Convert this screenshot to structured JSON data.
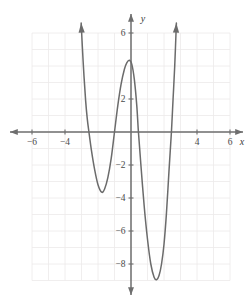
{
  "figure": {
    "kind": "cartesian-graph",
    "background_color": "#ffffff",
    "curve_color": "#6b6b6b",
    "axis_color": "#6e6e6e",
    "grid_color": "#eceaea",
    "label_color": "#4a4a4a"
  },
  "axes": {
    "x_axis_label": "x",
    "y_axis_label": "y",
    "x_ticks": [
      {
        "value": -6,
        "label": "−6"
      },
      {
        "value": -4,
        "label": "−4"
      },
      {
        "value": 4,
        "label": "4"
      },
      {
        "value": 6,
        "label": "6"
      }
    ],
    "y_ticks": [
      {
        "value": 6,
        "label": "6"
      },
      {
        "value": 2,
        "label": "2"
      },
      {
        "value": -2,
        "label": "−2"
      },
      {
        "value": -4,
        "label": "−4"
      },
      {
        "value": -6,
        "label": "−6"
      },
      {
        "value": -8,
        "label": "−8"
      }
    ],
    "x_arrow_left": true,
    "x_arrow_right": true,
    "y_arrow_up": true,
    "y_arrow_down": true
  },
  "chart_data": {
    "type": "line",
    "title": "",
    "xlabel": "x",
    "ylabel": "y",
    "xlim": [
      -7,
      7
    ],
    "ylim": [
      -10,
      7
    ],
    "grid": true,
    "grid_xrange": [
      -6,
      6
    ],
    "grid_yrange": [
      -9,
      6
    ],
    "legend": "none",
    "series": [
      {
        "name": "quartic-curve",
        "arrow_start": "up",
        "arrow_end": "up",
        "x_intercepts": [
          -2.55,
          -1.0,
          0.45,
          2.45
        ],
        "local_extrema": [
          {
            "kind": "minimum",
            "x": -1.78,
            "y": -3.65
          },
          {
            "kind": "maximum",
            "x": -0.1,
            "y": 4.35
          },
          {
            "kind": "minimum",
            "x": 1.55,
            "y": -8.95
          }
        ],
        "points": [
          {
            "x": -3.02,
            "y": 6.6
          },
          {
            "x": -2.95,
            "y": 5.2
          },
          {
            "x": -2.85,
            "y": 3.4
          },
          {
            "x": -2.75,
            "y": 1.9
          },
          {
            "x": -2.65,
            "y": 0.8
          },
          {
            "x": -2.55,
            "y": 0.0
          },
          {
            "x": -2.4,
            "y": -1.1
          },
          {
            "x": -2.2,
            "y": -2.3
          },
          {
            "x": -2.0,
            "y": -3.2
          },
          {
            "x": -1.78,
            "y": -3.65
          },
          {
            "x": -1.6,
            "y": -3.45
          },
          {
            "x": -1.4,
            "y": -2.75
          },
          {
            "x": -1.2,
            "y": -1.6
          },
          {
            "x": -1.0,
            "y": 0.0
          },
          {
            "x": -0.8,
            "y": 1.6
          },
          {
            "x": -0.6,
            "y": 2.9
          },
          {
            "x": -0.4,
            "y": 3.8
          },
          {
            "x": -0.25,
            "y": 4.2
          },
          {
            "x": -0.1,
            "y": 4.35
          },
          {
            "x": 0.05,
            "y": 4.1
          },
          {
            "x": 0.2,
            "y": 3.2
          },
          {
            "x": 0.35,
            "y": 1.6
          },
          {
            "x": 0.45,
            "y": 0.0
          },
          {
            "x": 0.6,
            "y": -2.0
          },
          {
            "x": 0.8,
            "y": -4.5
          },
          {
            "x": 1.0,
            "y": -6.5
          },
          {
            "x": 1.2,
            "y": -8.0
          },
          {
            "x": 1.4,
            "y": -8.8
          },
          {
            "x": 1.55,
            "y": -8.95
          },
          {
            "x": 1.7,
            "y": -8.7
          },
          {
            "x": 1.85,
            "y": -8.0
          },
          {
            "x": 2.0,
            "y": -6.8
          },
          {
            "x": 2.15,
            "y": -4.9
          },
          {
            "x": 2.3,
            "y": -2.4
          },
          {
            "x": 2.45,
            "y": 0.0
          },
          {
            "x": 2.55,
            "y": 2.0
          },
          {
            "x": 2.65,
            "y": 4.0
          },
          {
            "x": 2.75,
            "y": 6.6
          }
        ]
      }
    ]
  }
}
